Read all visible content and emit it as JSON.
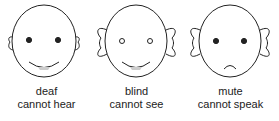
{
  "faces": [
    {
      "title": "deaf",
      "caption": "cannot hear",
      "eyes": "open-dots",
      "ears": "small",
      "mouth": "smile"
    },
    {
      "title": "blind",
      "caption": "cannot see",
      "eyes": "hollow-circles",
      "ears": "large",
      "mouth": "smile"
    },
    {
      "title": "mute",
      "caption": "cannot speak",
      "eyes": "open-dots",
      "ears": "large",
      "mouth": "frown"
    }
  ],
  "colors": {
    "stroke": "#222222",
    "background": "#ffffff",
    "mouth_fill": "#cccccc"
  }
}
